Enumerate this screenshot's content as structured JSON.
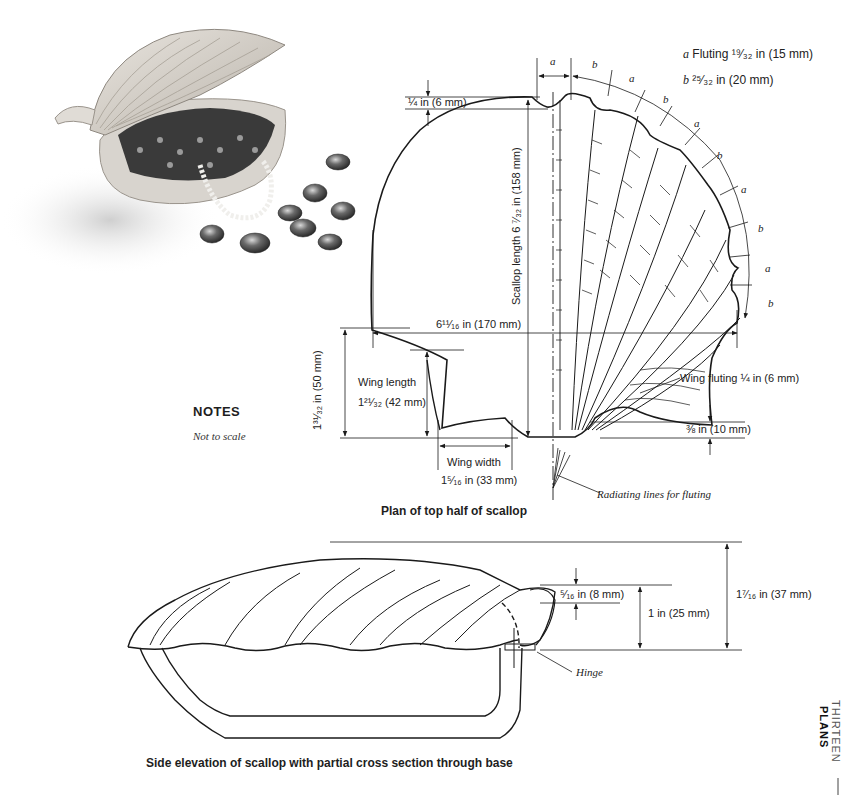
{
  "photo": {
    "alt": "Scallop-shaped wooden box with lid open, filled with beads and pearl necklace, glass pebbles scattered"
  },
  "legend": {
    "a_letter": "a",
    "a_text": "Fluting ¹⁹⁄₃₂ in (15 mm)",
    "b_letter": "b",
    "b_text": "²⁵⁄₃₂ in (20 mm)"
  },
  "plan": {
    "caption": "Plan of top half of scallop",
    "dims": {
      "top_notch": "¼ in (6 mm)",
      "scallop_length": "Scallop length 6 ⁷⁄₃₂ in (158 mm)",
      "width": "6¹¹⁄₁₆ in (170 mm)",
      "wing_height": "1³¹⁄₃₂ in (50 mm)",
      "wing_length_label": "Wing length",
      "wing_length_value": "1²¹⁄₃₂ (42 mm)",
      "wing_width_label": "Wing width",
      "wing_width_value": "1⁵⁄₁₆ in (33 mm)",
      "wing_fluting": "Wing fluting ¼ in (6 mm)",
      "base_offset": "⅜ in (10 mm)",
      "radiating": "Radiating lines for fluting"
    },
    "flute_labels": [
      "a",
      "b",
      "a",
      "b",
      "a",
      "b",
      "a",
      "b",
      "a",
      "b"
    ]
  },
  "notes": {
    "heading": "NOTES",
    "text": "Not to scale"
  },
  "elevation": {
    "caption": "Side elevation of scallop with partial cross section through base",
    "dims": {
      "lip": "⁵⁄₁₆ in (8 mm)",
      "hinge_height": "1 in (25 mm)",
      "total_height": "1⁷⁄₁₆ in (37 mm)",
      "hinge": "Hinge"
    }
  },
  "section_tab": {
    "chapter": "THIRTEEN",
    "title": "PLANS"
  }
}
